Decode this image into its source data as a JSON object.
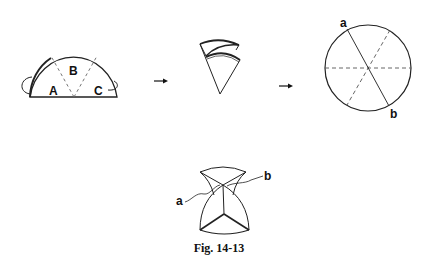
{
  "figure": {
    "caption": "Fig. 14-13",
    "colors": {
      "stroke": "#222222",
      "dashed": "#555555",
      "background": "#ffffff"
    }
  },
  "step1": {
    "description": "semicircle with three sectors, outer sectors folded behind",
    "labels": {
      "left": "A",
      "middle": "B",
      "right": "C"
    }
  },
  "step2": {
    "description": "folded cone"
  },
  "step3": {
    "description": "circle with fold lines",
    "labels": {
      "top": "a",
      "bottom": "b"
    }
  },
  "step4": {
    "description": "assembled shape with points a and b",
    "labels": {
      "left": "a",
      "right": "b"
    }
  },
  "arrows": [
    "arrow-1",
    "arrow-2"
  ]
}
